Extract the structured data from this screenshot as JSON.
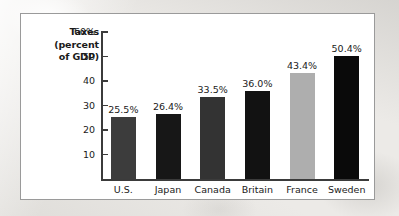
{
  "chart_data": {
    "type": "bar",
    "title": "",
    "ylabel": "Taxes (percent of GDP)",
    "ylabel_lines": [
      "Taxes",
      "(percent",
      "of GDP)"
    ],
    "xlabel": "",
    "categories": [
      "U.S.",
      "Japan",
      "Canada",
      "Britain",
      "France",
      "Sweden"
    ],
    "values": [
      25.5,
      26.4,
      33.5,
      36.0,
      43.4,
      50.4
    ],
    "value_labels": [
      "25.5%",
      "26.4%",
      "33.5%",
      "36.0%",
      "43.4%",
      "50.4%"
    ],
    "bar_colors": [
      "#3c3c3c",
      "#171717",
      "#333333",
      "#121212",
      "#aeaeae",
      "#0a0a0a"
    ],
    "ylim": [
      0,
      60
    ],
    "yticks": [
      10,
      20,
      30,
      40,
      50,
      60
    ],
    "ytick_labels": [
      "10",
      "20",
      "30",
      "40",
      "50",
      "60%"
    ],
    "grid": false,
    "legend": "none"
  },
  "panel": {
    "background": "#ffffff",
    "border_color": "#9a9a9a"
  }
}
